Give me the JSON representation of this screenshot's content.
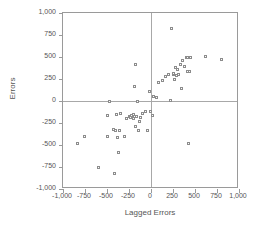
{
  "chart_data": {
    "type": "scatter",
    "title": "",
    "xlabel": "Lagged Errors",
    "ylabel": "Errors",
    "xlim": [
      -1000,
      1000
    ],
    "ylim": [
      -1000,
      1000
    ],
    "xticks": [
      -1000,
      -750,
      -500,
      -250,
      0,
      250,
      500,
      750,
      1000
    ],
    "yticks": [
      -1000,
      -750,
      -500,
      -250,
      0,
      250,
      500,
      750,
      1000
    ],
    "xticklabels": [
      "-1,000",
      "-750",
      "-500",
      "-250",
      "0",
      "250",
      "500",
      "750",
      "1,000"
    ],
    "yticklabels": [
      "-1,000",
      "-750",
      "-500",
      "-250",
      "0",
      "250",
      "500",
      "750",
      "1,000"
    ],
    "grid": false,
    "legend": null,
    "reference_lines": {
      "x": 0,
      "y": 0
    },
    "marker": {
      "shape": "open-square",
      "color": "#8c8c8c",
      "size": 3
    },
    "points": [
      [
        -830,
        -480
      ],
      [
        -760,
        -400
      ],
      [
        -600,
        -750
      ],
      [
        -500,
        -400
      ],
      [
        -490,
        -170
      ],
      [
        -470,
        -10
      ],
      [
        -430,
        -320
      ],
      [
        -420,
        -820
      ],
      [
        -400,
        -340
      ],
      [
        -390,
        -150
      ],
      [
        -380,
        -410
      ],
      [
        -370,
        -590
      ],
      [
        -360,
        -340
      ],
      [
        -350,
        -140
      ],
      [
        -300,
        -400
      ],
      [
        -280,
        -200
      ],
      [
        -250,
        -180
      ],
      [
        -230,
        -190
      ],
      [
        -225,
        -165
      ],
      [
        -215,
        -185
      ],
      [
        -200,
        -195
      ],
      [
        -195,
        -155
      ],
      [
        -190,
        170
      ],
      [
        -180,
        -290
      ],
      [
        -175,
        410
      ],
      [
        -160,
        -180
      ],
      [
        -150,
        -10
      ],
      [
        -140,
        -330
      ],
      [
        -130,
        -230
      ],
      [
        -120,
        -190
      ],
      [
        -100,
        -140
      ],
      [
        -60,
        -120
      ],
      [
        -40,
        -340
      ],
      [
        -20,
        110
      ],
      [
        -10,
        -120
      ],
      [
        20,
        -160
      ],
      [
        30,
        55
      ],
      [
        60,
        40
      ],
      [
        80,
        215
      ],
      [
        130,
        230
      ],
      [
        160,
        275
      ],
      [
        200,
        300
      ],
      [
        220,
        10
      ],
      [
        235,
        825
      ],
      [
        250,
        300
      ],
      [
        260,
        310
      ],
      [
        270,
        250
      ],
      [
        280,
        385
      ],
      [
        290,
        290
      ],
      [
        300,
        360
      ],
      [
        310,
        300
      ],
      [
        330,
        420
      ],
      [
        350,
        140
      ],
      [
        360,
        455
      ],
      [
        380,
        390
      ],
      [
        400,
        490
      ],
      [
        410,
        500
      ],
      [
        420,
        330
      ],
      [
        430,
        -480
      ],
      [
        440,
        340
      ],
      [
        450,
        495
      ],
      [
        620,
        505
      ],
      [
        800,
        470
      ]
    ]
  },
  "axis_titles": {
    "x": "Lagged Errors",
    "y": "Errors"
  }
}
